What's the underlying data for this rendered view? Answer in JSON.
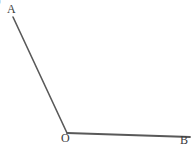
{
  "figure": {
    "kind": "geometry-angle-diagram",
    "width": 193,
    "height": 145,
    "background_color": "#ffffff",
    "stroke_color": "#595959",
    "label_color": "#3c3c3c",
    "item_number": ")",
    "labels": {
      "A": "A",
      "O": "O",
      "B": "B"
    },
    "points": {
      "A": {
        "x": 13,
        "y": 17
      },
      "O": {
        "x": 67,
        "y": 133
      },
      "B": {
        "x": 190,
        "y": 137
      }
    },
    "rays": [
      {
        "name": "ray-OA",
        "from": "O",
        "to": "A",
        "stroke_width": 1.6
      },
      {
        "name": "ray-OB",
        "from": "O",
        "to": "B",
        "stroke_width": 1.8
      }
    ]
  }
}
